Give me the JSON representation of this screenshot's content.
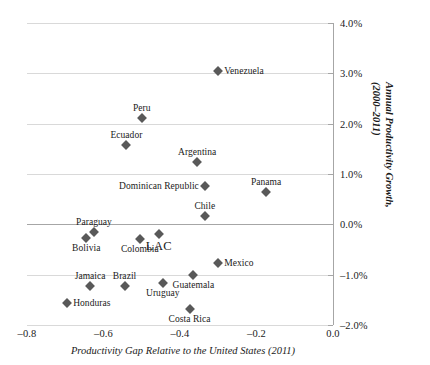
{
  "chart_data": {
    "type": "scatter",
    "title": "",
    "xlabel": "Productivity Gap Relative to the United States (2011)",
    "ylabel": "Annual Productivity Growth, (2000–2011)",
    "ylabel_line1": "Annual Productivity Growth,",
    "ylabel_line2": "(2000–2011)",
    "xlim": [
      -0.8,
      0.0
    ],
    "ylim": [
      -2.0,
      4.0
    ],
    "grid": true,
    "grid_axis": "y",
    "legend": "none",
    "marker_color": "#595959",
    "marker_shape": "diamond",
    "xticks": [
      "–0.8",
      "–0.6",
      "–0.4",
      "–0.2",
      "0.0"
    ],
    "xtick_values": [
      -0.8,
      -0.6,
      -0.4,
      -0.2,
      0.0
    ],
    "yticks": [
      "4.0%",
      "3.0%",
      "2.0%",
      "1.0%",
      "0.0%",
      "–1.0%",
      "–2.0%"
    ],
    "ytick_values": [
      4.0,
      3.0,
      2.0,
      1.0,
      0.0,
      -1.0,
      -2.0
    ],
    "yaxis_position": "right",
    "points": [
      {
        "name": "Venezuela",
        "x": -0.3,
        "y": 3.05,
        "label_pos": "w"
      },
      {
        "name": "Peru",
        "x": -0.5,
        "y": 2.12,
        "label_pos": "n"
      },
      {
        "name": "Ecuador",
        "x": -0.54,
        "y": 1.57,
        "label_pos": "n"
      },
      {
        "name": "Argentina",
        "x": -0.355,
        "y": 1.23,
        "label_pos": "n"
      },
      {
        "name": "Dominican Republic",
        "x": -0.335,
        "y": 0.77,
        "label_pos": "e"
      },
      {
        "name": "Panama",
        "x": -0.175,
        "y": 0.65,
        "label_pos": "n"
      },
      {
        "name": "Chile",
        "x": -0.335,
        "y": 0.17,
        "label_pos": "n"
      },
      {
        "name": "Paraguay",
        "x": -0.625,
        "y": -0.16,
        "label_pos": "n"
      },
      {
        "name": "Bolivia",
        "x": -0.645,
        "y": -0.28,
        "label_pos": "s"
      },
      {
        "name": "Colombia",
        "x": -0.505,
        "y": -0.3,
        "label_pos": "s"
      },
      {
        "name": "LAC",
        "x": -0.455,
        "y": -0.19,
        "label_pos": "s"
      },
      {
        "name": "Mexico",
        "x": -0.3,
        "y": -0.76,
        "label_pos": "w"
      },
      {
        "name": "Guatemala",
        "x": -0.365,
        "y": -1.01,
        "label_pos": "s"
      },
      {
        "name": "Uruguay",
        "x": -0.445,
        "y": -1.16,
        "label_pos": "s"
      },
      {
        "name": "Brazil",
        "x": -0.545,
        "y": -1.23,
        "label_pos": "n"
      },
      {
        "name": "Jamaica",
        "x": -0.635,
        "y": -1.23,
        "label_pos": "n"
      },
      {
        "name": "Honduras",
        "x": -0.695,
        "y": -1.56,
        "label_pos": "w"
      },
      {
        "name": "Costa Rica",
        "x": -0.375,
        "y": -1.68,
        "label_pos": "s"
      }
    ]
  }
}
